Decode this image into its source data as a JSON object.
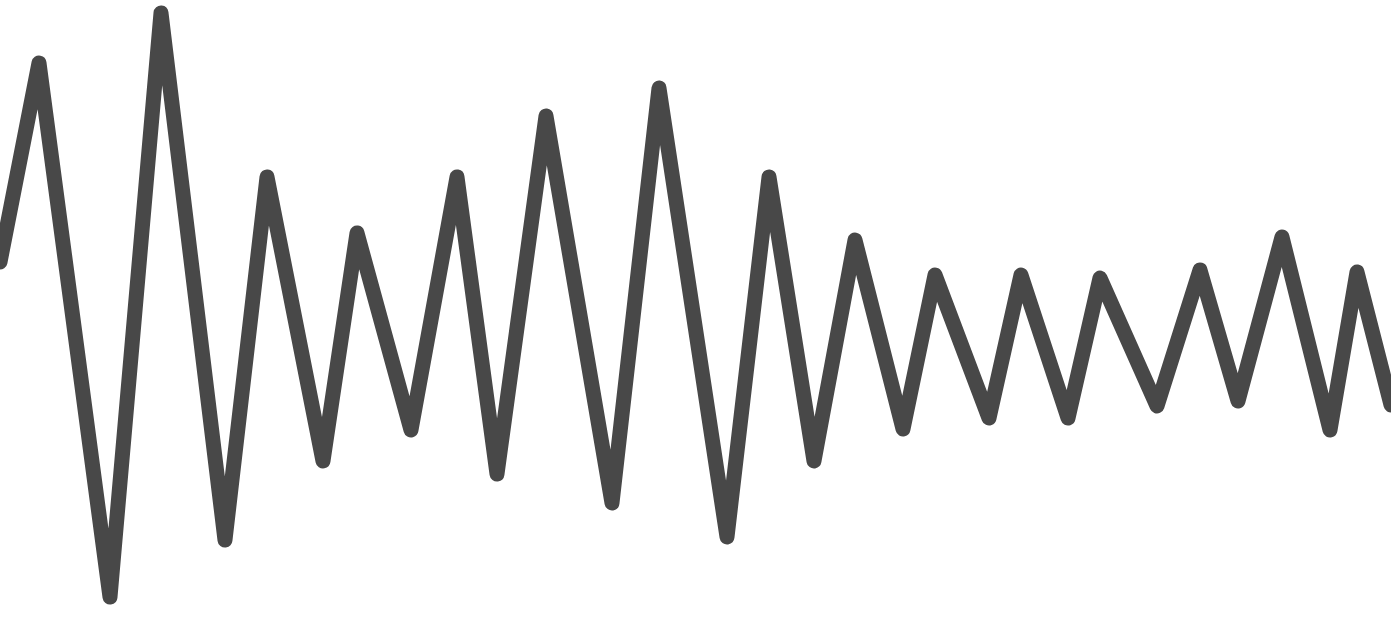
{
  "figure": {
    "type": "zigzag-waveform",
    "background_color": "#ffffff",
    "stroke_color": "#484848",
    "stroke_width": 15,
    "width": 1391,
    "height": 639
  },
  "waveform": {
    "points": [
      [
        0,
        262
      ],
      [
        39,
        63
      ],
      [
        110,
        597
      ],
      [
        161,
        13
      ],
      [
        225,
        540
      ],
      [
        267,
        177
      ],
      [
        323,
        461
      ],
      [
        357,
        233
      ],
      [
        411,
        430
      ],
      [
        457,
        177
      ],
      [
        497,
        474
      ],
      [
        546,
        116
      ],
      [
        612,
        503
      ],
      [
        659,
        88
      ],
      [
        727,
        537
      ],
      [
        769,
        177
      ],
      [
        814,
        461
      ],
      [
        855,
        240
      ],
      [
        903,
        429
      ],
      [
        935,
        275
      ],
      [
        989,
        418
      ],
      [
        1021,
        275
      ],
      [
        1068,
        418
      ],
      [
        1100,
        278
      ],
      [
        1157,
        406
      ],
      [
        1200,
        270
      ],
      [
        1238,
        401
      ],
      [
        1282,
        237
      ],
      [
        1330,
        430
      ],
      [
        1357,
        272
      ],
      [
        1391,
        405
      ]
    ]
  }
}
